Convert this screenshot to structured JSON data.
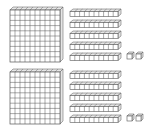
{
  "diagram": {
    "stroke_color": "#555555",
    "fill_color": "#ffffff",
    "side_fill": "#e6e6e6",
    "groups": [
      {
        "name": "group-1",
        "y": 7,
        "hundreds": 1,
        "tens": 5,
        "ones": 2,
        "value": 152
      },
      {
        "name": "group-2",
        "y": 69,
        "hundreds": 1,
        "tens": 5,
        "ones": 2,
        "value": 152
      }
    ]
  }
}
